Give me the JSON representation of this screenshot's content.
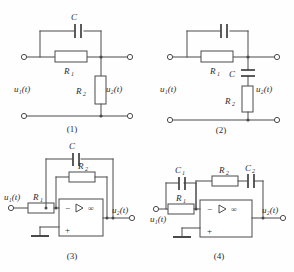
{
  "figure": {
    "type": "circuit-diagram-set",
    "panel_count": 4,
    "background_color": "#fefefe",
    "line_color": "#4a4a4a"
  },
  "circuits": [
    {
      "id": "circuit-1",
      "caption": "(1)",
      "input_label": "u₁(t)",
      "output_label": "u₂(t)",
      "components": [
        {
          "name": "C",
          "type": "capacitor",
          "orientation": "horizontal-plates-vertical",
          "position": "top-parallel-branch"
        },
        {
          "name": "R₁",
          "type": "resistor",
          "orientation": "horizontal",
          "position": "series-top"
        },
        {
          "name": "R₂",
          "type": "resistor",
          "orientation": "vertical",
          "position": "shunt-right"
        }
      ],
      "labels": {
        "c": "C",
        "r1": "R",
        "r1_sub": "1",
        "r2": "R",
        "r2_sub": "2"
      }
    },
    {
      "id": "circuit-2",
      "caption": "(2)",
      "input_label": "u₁(t)",
      "output_label": "u₂(t)",
      "components": [
        {
          "name": "",
          "type": "capacitor",
          "orientation": "vertical-plates",
          "position": "top-parallel-branch",
          "unlabeled": true
        },
        {
          "name": "R₁",
          "type": "resistor",
          "orientation": "horizontal",
          "position": "series-top"
        },
        {
          "name": "C",
          "type": "capacitor",
          "orientation": "horizontal-plates",
          "position": "shunt-right-upper"
        },
        {
          "name": "R₂",
          "type": "resistor",
          "orientation": "vertical",
          "position": "shunt-right-lower"
        }
      ],
      "labels": {
        "r1": "R",
        "r1_sub": "1",
        "c": "C",
        "r2": "R",
        "r2_sub": "2"
      }
    },
    {
      "id": "circuit-3",
      "caption": "(3)",
      "input_label": "u₁(t)",
      "output_label": "u₂(t)",
      "opamp": {
        "inverting_sign": "−",
        "noninverting_sign": "+",
        "gain_symbol": "∞",
        "has_ground": true
      },
      "components": [
        {
          "name": "R₁",
          "type": "resistor",
          "orientation": "horizontal",
          "position": "input-series"
        },
        {
          "name": "C",
          "type": "capacitor",
          "orientation": "vertical-plates",
          "position": "feedback-outer"
        },
        {
          "name": "R₂",
          "type": "resistor",
          "orientation": "horizontal",
          "position": "feedback-inner"
        }
      ],
      "labels": {
        "r1": "R",
        "r1_sub": "1",
        "c": "C",
        "r2": "R",
        "r2_sub": "2"
      }
    },
    {
      "id": "circuit-4",
      "caption": "(4)",
      "input_label": "u₁(t)",
      "output_label": "u₂(t)",
      "opamp": {
        "inverting_sign": "−",
        "noninverting_sign": "+",
        "gain_symbol": "∞",
        "has_ground": true
      },
      "components": [
        {
          "name": "C₁",
          "type": "capacitor",
          "orientation": "vertical-plates",
          "position": "input-parallel"
        },
        {
          "name": "R₁",
          "type": "resistor",
          "orientation": "horizontal",
          "position": "input-series"
        },
        {
          "name": "R₂",
          "type": "resistor",
          "orientation": "horizontal",
          "position": "feedback-series"
        },
        {
          "name": "C₂",
          "type": "capacitor",
          "orientation": "vertical-plates",
          "position": "feedback-series"
        }
      ],
      "labels": {
        "c1": "C",
        "c1_sub": "1",
        "r1": "R",
        "r1_sub": "1",
        "r2": "R",
        "r2_sub": "2",
        "c2": "C",
        "c2_sub": "2"
      }
    }
  ]
}
